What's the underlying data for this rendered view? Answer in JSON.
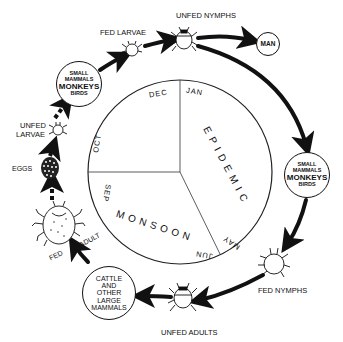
{
  "diagram": {
    "type": "life-cycle",
    "stages": {
      "unfed_nymphs": "UNFED NYMPHS",
      "fed_larvae": "FED LARVAE",
      "unfed_larvae": [
        "UNFED",
        "LARVAE"
      ],
      "eggs": "EGGS",
      "fed_adult": [
        "FED",
        "ADULT"
      ],
      "unfed_adults": "UNFED ADULTS",
      "fed_nymphs": "FED NYMPHS"
    },
    "hosts": {
      "man": "MAN",
      "small_hosts_left": [
        "SMALL",
        "MAMMALS",
        "MONKEYS",
        "BIRDS"
      ],
      "small_hosts_right": [
        "SMALL",
        "MAMMALS",
        "MONKEYS",
        "BIRDS"
      ],
      "large_hosts": [
        "CATTLE",
        "AND",
        "OTHER",
        "LARGE",
        "MAMMALS"
      ]
    },
    "calendar": {
      "months": {
        "dec": "DEC",
        "jan": "JAN",
        "oct": "OCT",
        "sep": "SEP",
        "may": "MAY",
        "jun": "JUN"
      },
      "seasons": {
        "epidemic": "EPIDEMIC",
        "monsoon": "MONSOON"
      }
    }
  }
}
